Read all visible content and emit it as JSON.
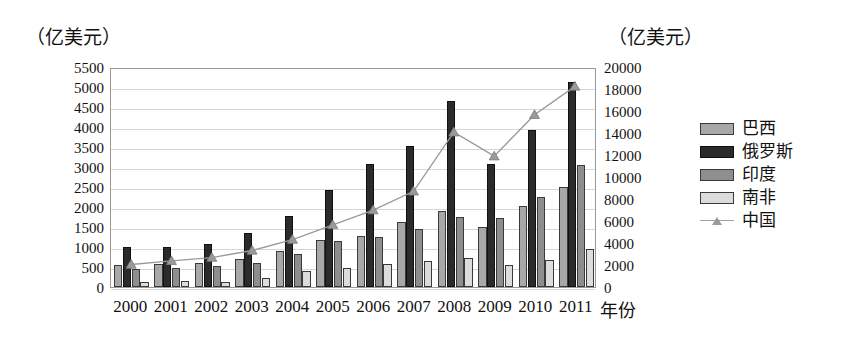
{
  "chart_data": {
    "type": "bar",
    "title": "",
    "left_axis_unit": "（亿美元）",
    "right_axis_unit": "（亿美元）",
    "xlabel": "年份",
    "ylabel": "",
    "grid": true,
    "legend_position": "right",
    "categories": [
      "2000",
      "2001",
      "2002",
      "2003",
      "2004",
      "2005",
      "2006",
      "2007",
      "2008",
      "2009",
      "2010",
      "2011"
    ],
    "ylim": [
      0,
      5500
    ],
    "y_ticks": [
      "5500",
      "5000",
      "4500",
      "4000",
      "3500",
      "3000",
      "2500",
      "2000",
      "1500",
      "1000",
      "500",
      "0"
    ],
    "y2lim": [
      0,
      20000
    ],
    "y2_ticks": [
      "20000",
      "18000",
      "16000",
      "14000",
      "12000",
      "10000",
      "8000",
      "6000",
      "4000",
      "2000",
      "0"
    ],
    "series": [
      {
        "name": "巴西",
        "axis": "left",
        "type": "bar",
        "color": "#a8a8a8",
        "values": [
          550,
          570,
          600,
          700,
          900,
          1180,
          1280,
          1620,
          1900,
          1500,
          2020,
          2500
        ]
      },
      {
        "name": "俄罗斯",
        "axis": "left",
        "type": "bar",
        "color": "#2b2b2b",
        "values": [
          1000,
          1000,
          1080,
          1350,
          1780,
          2430,
          3080,
          3530,
          4650,
          3080,
          3920,
          5120
        ]
      },
      {
        "name": "印度",
        "axis": "left",
        "type": "bar",
        "color": "#8e8e8e",
        "values": [
          460,
          480,
          520,
          600,
          820,
          1160,
          1250,
          1460,
          1750,
          1720,
          2250,
          3050
        ]
      },
      {
        "name": "南非",
        "axis": "left",
        "type": "bar",
        "color": "#dcdcdc",
        "values": [
          130,
          140,
          120,
          220,
          390,
          480,
          580,
          650,
          730,
          560,
          680,
          950
        ]
      },
      {
        "name": "中国",
        "axis": "right",
        "type": "line",
        "color": "#9a9a9a",
        "values": [
          2060,
          2400,
          2700,
          3350,
          4350,
          5700,
          7050,
          8780,
          14200,
          12000,
          15800,
          18400
        ]
      }
    ]
  },
  "legend": {
    "items": [
      {
        "label": "巴西",
        "style": "s0"
      },
      {
        "label": "俄罗斯",
        "style": "s1"
      },
      {
        "label": "印度",
        "style": "s2"
      },
      {
        "label": "南非",
        "style": "s3"
      },
      {
        "label": "中国",
        "style": "line"
      }
    ]
  }
}
